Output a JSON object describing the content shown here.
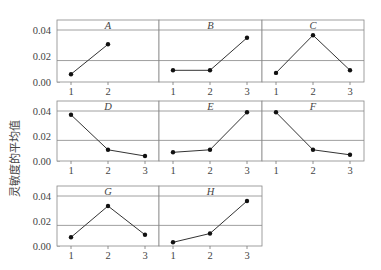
{
  "chart_data": {
    "type": "line",
    "layout": "faceted-grid",
    "ylabel": "灵敏度的平均值",
    "xlabel": "",
    "ylim": [
      0.0,
      0.048
    ],
    "yticks": [
      0.0,
      0.02,
      0.04
    ],
    "ytick_labels": [
      "0.00",
      "0.02",
      "0.04"
    ],
    "reference_lines": [
      0.04,
      0.0165
    ],
    "marker": "filled-circle",
    "line_color": "#333333",
    "panels": [
      {
        "title": "A",
        "row": 1,
        "col": 1,
        "x": [
          1,
          2
        ],
        "x_labels": [
          "1",
          "2"
        ],
        "values": [
          0.006,
          0.029
        ]
      },
      {
        "title": "B",
        "row": 1,
        "col": 2,
        "x": [
          1,
          2,
          3
        ],
        "x_labels": [
          "1",
          "2",
          "3"
        ],
        "values": [
          0.009,
          0.009,
          0.034
        ]
      },
      {
        "title": "C",
        "row": 1,
        "col": 3,
        "x": [
          1,
          2,
          3
        ],
        "x_labels": [
          "1",
          "2",
          "3"
        ],
        "values": [
          0.007,
          0.036,
          0.009
        ]
      },
      {
        "title": "D",
        "row": 2,
        "col": 1,
        "x": [
          1,
          2,
          3
        ],
        "x_labels": [
          "1",
          "2",
          "3"
        ],
        "values": [
          0.037,
          0.009,
          0.004
        ]
      },
      {
        "title": "E",
        "row": 2,
        "col": 2,
        "x": [
          1,
          2,
          3
        ],
        "x_labels": [
          "1",
          "2",
          "3"
        ],
        "values": [
          0.007,
          0.009,
          0.039
        ]
      },
      {
        "title": "F",
        "row": 2,
        "col": 3,
        "x": [
          1,
          2,
          3
        ],
        "x_labels": [
          "1",
          "2",
          "3"
        ],
        "values": [
          0.039,
          0.009,
          0.005
        ]
      },
      {
        "title": "G",
        "row": 3,
        "col": 1,
        "x": [
          1,
          2,
          3
        ],
        "x_labels": [
          "1",
          "2",
          "3"
        ],
        "values": [
          0.007,
          0.032,
          0.009
        ]
      },
      {
        "title": "H",
        "row": 3,
        "col": 2,
        "x": [
          1,
          2,
          3
        ],
        "x_labels": [
          "1",
          "2",
          "3"
        ],
        "values": [
          0.003,
          0.01,
          0.036
        ]
      }
    ]
  }
}
